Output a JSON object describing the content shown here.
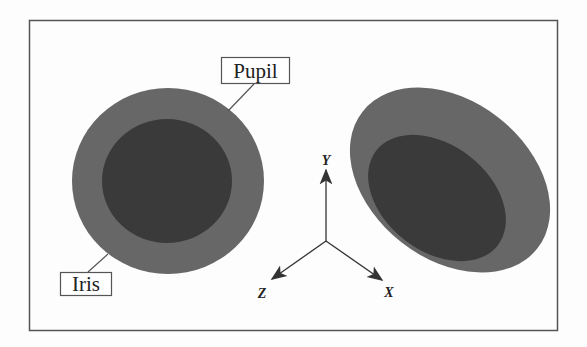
{
  "figure": {
    "labels": {
      "pupil": "Pupil",
      "iris": "Iris"
    },
    "axes": {
      "x": "X",
      "y": "Y",
      "z": "Z"
    },
    "colors": {
      "background": "#fdfdfd",
      "frame": "#555555",
      "iris": "#676767",
      "pupil": "#3a3a3a",
      "axis": "#333333"
    }
  }
}
